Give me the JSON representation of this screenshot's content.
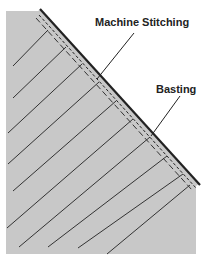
{
  "diagram": {
    "type": "sewing-illustration",
    "labels": {
      "machine_stitching": "Machine Stitching",
      "basting": "Basting"
    },
    "colors": {
      "fabric": "#c8c8c8",
      "edge": "#222222",
      "lines": "#333333",
      "background": "#ffffff"
    }
  }
}
